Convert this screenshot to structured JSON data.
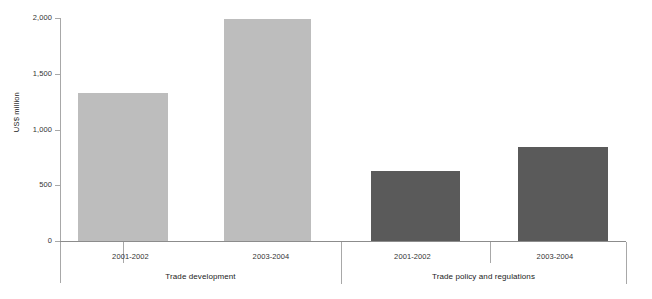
{
  "chart_data": {
    "type": "bar",
    "title": "",
    "subtitle": "",
    "xlabel": "",
    "ylabel": "US$ million",
    "ylim": [
      0,
      2000
    ],
    "ytick_labels": [
      "2,000",
      "1,500",
      "1,000",
      "500",
      "0"
    ],
    "ytick_values": [
      2000,
      1500,
      1000,
      500,
      0
    ],
    "grid": false,
    "legend": "none",
    "groups": [
      {
        "name": "Trade development",
        "categories": [
          "2001-2002",
          "2003-2004"
        ],
        "values": [
          1330,
          1990
        ],
        "color": "#bdbdbd"
      },
      {
        "name": "Trade policy and regulations",
        "categories": [
          "2001-2002",
          "2003-2004"
        ],
        "values": [
          630,
          840
        ],
        "color": "#5a5a5a"
      }
    ],
    "categories": [
      "2001-2002",
      "2003-2004",
      "2001-2002",
      "2003-2004"
    ],
    "values": [
      1330,
      1990,
      630,
      840
    ],
    "colors": [
      "#bdbdbd",
      "#bdbdbd",
      "#5a5a5a",
      "#5a5a5a"
    ],
    "axis_color": "#8c8c8c"
  }
}
